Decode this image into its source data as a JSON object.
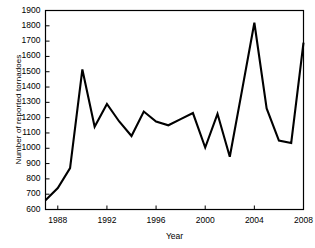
{
  "chart_data": {
    "type": "line",
    "title": "",
    "xlabel": "Year",
    "ylabel": "Number of reported tornadoes",
    "xlim": [
      1987,
      2008
    ],
    "ylim": [
      600,
      1900
    ],
    "ytick_step": 100,
    "xtick_step": 4,
    "grid": false,
    "legend": "none",
    "line_color": "#000000",
    "frame_color": "#000000",
    "background_color": "#ffffff",
    "x": [
      1987,
      1988,
      1989,
      1990,
      1991,
      1992,
      1993,
      1994,
      1995,
      1996,
      1997,
      1998,
      1999,
      2000,
      2001,
      2002,
      2003,
      2004,
      2005,
      2006,
      2007,
      2008
    ],
    "values": [
      660,
      740,
      870,
      1515,
      1140,
      1290,
      1175,
      1080,
      1240,
      1175,
      1150,
      1190,
      1230,
      1005,
      1225,
      945,
      1380,
      1820,
      1260,
      1050,
      1035,
      1690
    ],
    "ytick_labels": [
      "1900",
      "1800",
      "1700",
      "1600",
      "1500",
      "1400",
      "1300",
      "1200",
      "1100",
      "1000",
      "900",
      "800",
      "700",
      "600"
    ],
    "ytick_values": [
      1900,
      1800,
      1700,
      1600,
      1500,
      1400,
      1300,
      1200,
      1100,
      1000,
      900,
      800,
      700,
      600
    ],
    "xtick_labels": [
      "1988",
      "1992",
      "1996",
      "2000",
      "2004",
      "2008"
    ],
    "xtick_values": [
      1988,
      1992,
      1996,
      2000,
      2004,
      2008
    ]
  }
}
